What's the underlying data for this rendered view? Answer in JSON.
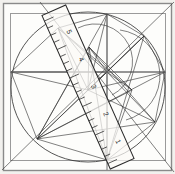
{
  "figure": {
    "title": "Geometric construction with ruler",
    "background_color": "#f2f1ee",
    "paper_color": "#fdfdfb",
    "ink_color": "#2b2b2b",
    "border_color": "#8a8a8a",
    "ruler": {
      "label": "ruler-overlay",
      "body_color": "#fbfaf7",
      "edge_color": "#2b2b2b",
      "tick_marks": 21,
      "numbers": [
        "1",
        "2",
        "3",
        "4",
        "5"
      ],
      "angle_degrees": -24
    },
    "shapes": {
      "outer_frame": "square-border",
      "inner_frame": "inset-square",
      "circle": "inscribed-circle",
      "axis_horizontal": "horizontal-axis",
      "axis_vertical": "vertical-axis"
    }
  },
  "chart_data": {
    "type": "scatter",
    "title": "Geometric construction with ruler",
    "xlabel": "",
    "ylabel": "",
    "xlim": [
      0,
      175
    ],
    "ylim": [
      0,
      174
    ],
    "grid": false,
    "legend": "none",
    "annotations": [
      "1",
      "2",
      "3",
      "4",
      "5"
    ],
    "nodes": [
      {
        "name": "A",
        "x": 58,
        "y": 28
      },
      {
        "name": "B",
        "x": 107,
        "y": 14
      },
      {
        "name": "C",
        "x": 144,
        "y": 36
      },
      {
        "name": "D",
        "x": 165,
        "y": 72
      },
      {
        "name": "E",
        "x": 155,
        "y": 122
      },
      {
        "name": "F",
        "x": 107,
        "y": 160
      },
      {
        "name": "G",
        "x": 37,
        "y": 139
      },
      {
        "name": "H",
        "x": 11,
        "y": 72
      },
      {
        "name": "I",
        "x": 107,
        "y": 72
      },
      {
        "name": "J",
        "x": 88,
        "y": 90
      },
      {
        "name": "K",
        "x": 89,
        "y": 47
      },
      {
        "name": "L",
        "x": 132,
        "y": 90
      }
    ],
    "edges": [
      [
        "H",
        "A"
      ],
      [
        "A",
        "B"
      ],
      [
        "B",
        "C"
      ],
      [
        "C",
        "D"
      ],
      [
        "D",
        "E"
      ],
      [
        "E",
        "F"
      ],
      [
        "F",
        "G"
      ],
      [
        "G",
        "H"
      ],
      [
        "A",
        "I"
      ],
      [
        "A",
        "J"
      ],
      [
        "A",
        "F"
      ],
      [
        "A",
        "L"
      ],
      [
        "B",
        "I"
      ],
      [
        "B",
        "J"
      ],
      [
        "B",
        "G"
      ],
      [
        "C",
        "I"
      ],
      [
        "C",
        "J"
      ],
      [
        "C",
        "G"
      ],
      [
        "C",
        "F"
      ],
      [
        "D",
        "H"
      ],
      [
        "D",
        "J"
      ],
      [
        "D",
        "G"
      ],
      [
        "E",
        "I"
      ],
      [
        "E",
        "J"
      ],
      [
        "E",
        "G"
      ],
      [
        "E",
        "K"
      ],
      [
        "F",
        "I"
      ],
      [
        "F",
        "K"
      ],
      [
        "F",
        "L"
      ],
      [
        "G",
        "I"
      ],
      [
        "G",
        "K"
      ],
      [
        "G",
        "L"
      ],
      [
        "H",
        "I"
      ],
      [
        "H",
        "J"
      ],
      [
        "I",
        "J"
      ],
      [
        "I",
        "K"
      ],
      [
        "I",
        "L"
      ],
      [
        "J",
        "K"
      ],
      [
        "K",
        "L"
      ]
    ]
  }
}
